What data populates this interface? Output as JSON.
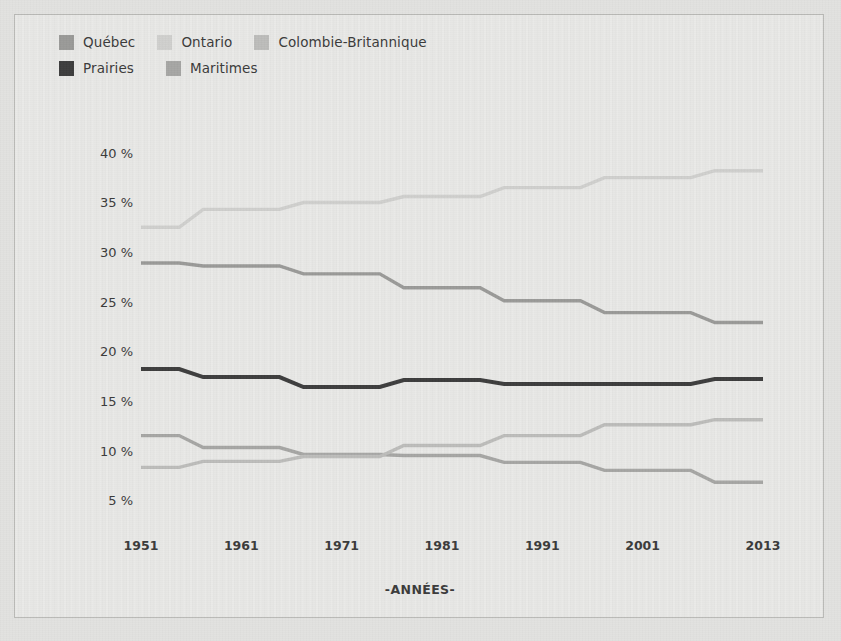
{
  "figure": {
    "background_color": "#e7e7e5",
    "frame_color": "#b9b9b6",
    "page_color": "#e2e2e0"
  },
  "legend": {
    "position": "top-left",
    "rows": [
      [
        {
          "label": "Québec",
          "color": "#9a9a98",
          "swatch_name": "legend-swatch-quebec"
        },
        {
          "label": "Ontario",
          "color": "#cfcfcd",
          "swatch_name": "legend-swatch-ontario"
        },
        {
          "label": "Colombie-Britannique",
          "color": "#bcbcba",
          "swatch_name": "legend-swatch-colombie-britannique"
        }
      ],
      [
        {
          "label": "Prairies",
          "color": "#3d3d3d",
          "swatch_name": "legend-swatch-prairies"
        },
        {
          "label": "Maritimes",
          "color": "#a6a6a4",
          "swatch_name": "legend-swatch-maritimes"
        }
      ]
    ]
  },
  "chart_data": {
    "type": "line",
    "title": "",
    "subtitle": "",
    "xlabel": "-ANNÉES-",
    "ylabel": "",
    "x": [
      1951,
      1961,
      1971,
      1981,
      1991,
      2001,
      2013
    ],
    "categories": [
      "1951",
      "1961",
      "1971",
      "1981",
      "1991",
      "2001",
      "2013"
    ],
    "xtick_labels": [
      "1951",
      "1961",
      "1971",
      "1981",
      "1991",
      "2001",
      "2013"
    ],
    "ytick_labels": [
      "40 %",
      "35 %",
      "30 %",
      "25 %",
      "20 %",
      "15 %",
      "10 %",
      "5 %"
    ],
    "ytick_values": [
      40,
      35,
      30,
      25,
      20,
      15,
      10,
      5
    ],
    "ylim": [
      3.5,
      42
    ],
    "xlim": [
      1951,
      2013
    ],
    "grid": false,
    "legend_position": "top-left",
    "step_style": "step-mid",
    "series": [
      {
        "name": "Ontario",
        "color": "#cfcfcd",
        "values": [
          32.5,
          34.3,
          35.0,
          35.6,
          36.5,
          37.5,
          38.2
        ]
      },
      {
        "name": "Québec",
        "color": "#9a9a98",
        "values": [
          28.9,
          28.6,
          27.8,
          26.4,
          25.1,
          23.9,
          22.9
        ]
      },
      {
        "name": "Prairies",
        "color": "#3d3d3d",
        "values": [
          18.2,
          17.4,
          16.4,
          17.1,
          16.7,
          16.7,
          17.2
        ]
      },
      {
        "name": "Maritimes",
        "color": "#a6a6a4",
        "values": [
          11.5,
          10.3,
          9.6,
          9.5,
          8.8,
          8.0,
          6.8
        ]
      },
      {
        "name": "Colombie-Britannique",
        "color": "#bcbcba",
        "values": [
          8.3,
          8.9,
          9.4,
          10.5,
          11.5,
          12.6,
          13.1
        ]
      }
    ]
  }
}
